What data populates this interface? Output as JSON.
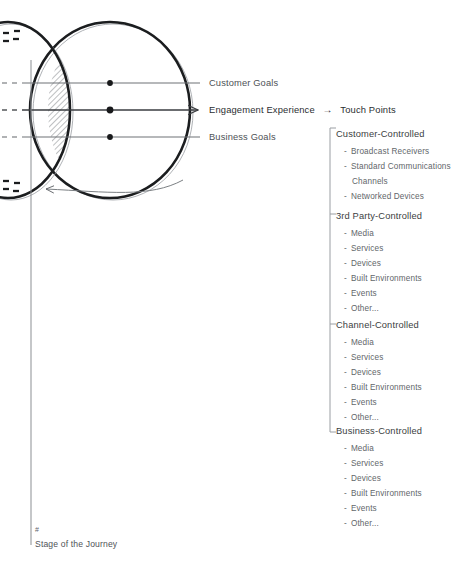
{
  "diagram": {
    "title_hidden": "",
    "axes": {
      "vertical_axis_label": "Stage of the Journey",
      "vertical_axis_marker": "#"
    },
    "rows": [
      {
        "name": "customer-goals",
        "label": "Customer Goals",
        "y": 83,
        "has_arrow": false
      },
      {
        "name": "engagement-experience",
        "label": "Engagement Experience",
        "y": 110,
        "has_arrow": true
      },
      {
        "name": "business-goals",
        "label": "Business Goals",
        "y": 137,
        "has_arrow": false
      }
    ],
    "flow_arrow": "→",
    "touch_points_title": "Touch Points",
    "colors": {
      "ink": "#2b2e31",
      "text": "#55595d",
      "subtext": "#62666a",
      "rule": "#6f7377",
      "curve_dark": "#1b1d1f",
      "curve_light": "#8d9196",
      "hatch": "#6d7175"
    }
  },
  "touch_points": {
    "groups": [
      {
        "name": "customer-controlled",
        "label": "Customer-Controlled",
        "items": [
          "Broadcast Receivers",
          "Standard Communications",
          "Channels",
          "Networked Devices"
        ]
      },
      {
        "name": "third-party-controlled",
        "label": "3rd Party-Controlled",
        "items": [
          "Media",
          "Services",
          "Devices",
          "Built Environments",
          "Events",
          "Other..."
        ]
      },
      {
        "name": "channel-controlled",
        "label": "Channel-Controlled",
        "items": [
          "Media",
          "Services",
          "Devices",
          "Built Environments",
          "Events",
          "Other..."
        ]
      },
      {
        "name": "business-controlled",
        "label": "Business-Controlled",
        "items": [
          "Media",
          "Services",
          "Devices",
          "Built Environments",
          "Events",
          "Other..."
        ]
      }
    ],
    "bullet": "-"
  }
}
